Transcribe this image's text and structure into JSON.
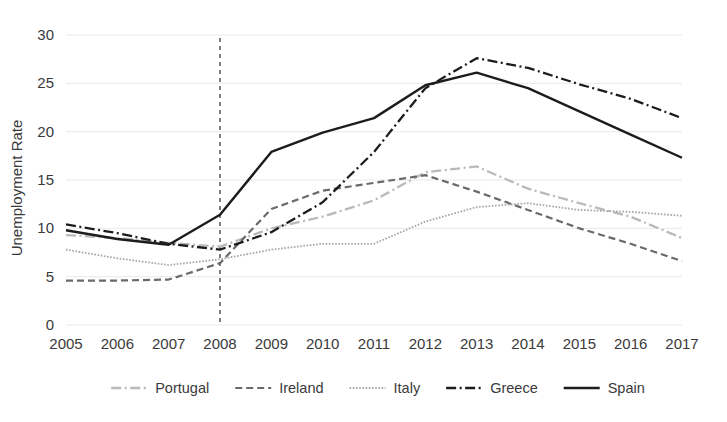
{
  "chart_data": {
    "type": "line",
    "title": "",
    "xlabel": "",
    "ylabel": "Unemployment Rate",
    "x": [
      2005,
      2006,
      2007,
      2008,
      2009,
      2010,
      2011,
      2012,
      2013,
      2014,
      2015,
      2016,
      2017
    ],
    "xtick_labels": [
      "2005",
      "2006",
      "2007",
      "2008",
      "2009",
      "2010",
      "2011",
      "2012",
      "2013",
      "2014",
      "2015",
      "2016",
      "2017"
    ],
    "ytick_labels": [
      "0",
      "5",
      "10",
      "15",
      "20",
      "25",
      "30"
    ],
    "yticks": [
      0,
      5,
      10,
      15,
      20,
      25,
      30
    ],
    "xlim": [
      2005,
      2017
    ],
    "ylim": [
      0,
      30
    ],
    "grid": "horizontal",
    "legend_position": "bottom",
    "annotations": [
      {
        "name": "crisis-reference-line",
        "type": "vline",
        "x": 2008,
        "style": "dashed"
      }
    ],
    "series": [
      {
        "name": "Portugal",
        "color": "#b9b9b9",
        "dash": "dashdot",
        "values": [
          9.3,
          9.0,
          8.5,
          8.1,
          10.0,
          11.2,
          12.9,
          15.8,
          16.4,
          14.1,
          12.6,
          11.2,
          9.0
        ]
      },
      {
        "name": "Ireland",
        "color": "#6a6a6a",
        "dash": "dashed",
        "values": [
          4.6,
          4.6,
          4.7,
          6.4,
          12.0,
          13.9,
          14.7,
          15.5,
          13.8,
          11.9,
          10.0,
          8.4,
          6.6
        ]
      },
      {
        "name": "Italy",
        "color": "#a6a6a6",
        "dash": "dotted",
        "values": [
          7.8,
          6.9,
          6.2,
          6.8,
          7.8,
          8.4,
          8.4,
          10.7,
          12.2,
          12.6,
          11.9,
          11.7,
          11.3
        ]
      },
      {
        "name": "Greece",
        "color": "#1c1c1c",
        "dash": "dashdot",
        "values": [
          10.4,
          9.5,
          8.4,
          7.8,
          9.6,
          12.7,
          17.9,
          24.5,
          27.6,
          26.6,
          24.9,
          23.4,
          21.4
        ]
      },
      {
        "name": "Spain",
        "color": "#1c1c1c",
        "dash": "solid",
        "values": [
          9.8,
          8.9,
          8.3,
          11.4,
          17.9,
          19.9,
          21.4,
          24.8,
          26.1,
          24.5,
          22.1,
          19.7,
          17.3
        ]
      }
    ]
  },
  "legend": {
    "items": [
      {
        "label": "Portugal"
      },
      {
        "label": "Ireland"
      },
      {
        "label": "Italy"
      },
      {
        "label": "Greece"
      },
      {
        "label": "Spain"
      }
    ]
  },
  "axes": {
    "y_title": "Unemployment Rate"
  }
}
